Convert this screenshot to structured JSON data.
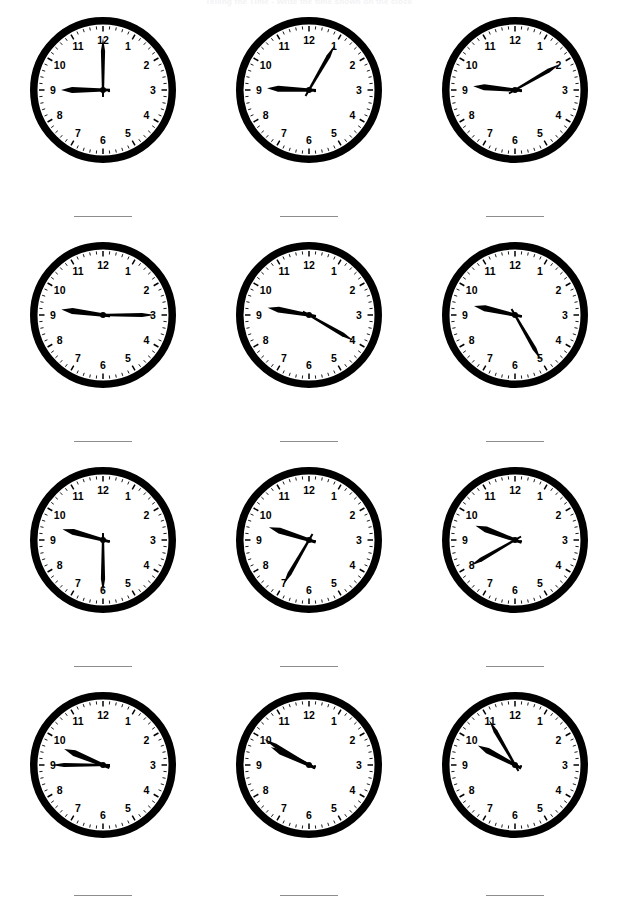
{
  "worksheet": {
    "title": "Telling the Time - Write the time shown on the clock",
    "rows": 4,
    "columns": 3,
    "clock_count": 12,
    "answer_line_placeholder": ""
  },
  "clock_face": {
    "rim_color": "#000000",
    "face_color": "#ffffff",
    "hand_color": "#000000",
    "numeral_color": "#000000",
    "tick_color": "#000000",
    "hour_numerals": [
      "12",
      "1",
      "2",
      "3",
      "4",
      "5",
      "6",
      "7",
      "8",
      "9",
      "10",
      "11"
    ]
  },
  "chart_data": {
    "type": "table",
    "title": "Telling the Time - Write the time shown on the clock",
    "categories": [
      "clock-1",
      "clock-2",
      "clock-3",
      "clock-4",
      "clock-5",
      "clock-6",
      "clock-7",
      "clock-8",
      "clock-9",
      "clock-10",
      "clock-11",
      "clock-12"
    ],
    "values": [
      {
        "index": 1,
        "time": "9:00",
        "hour": 9,
        "minute": 0,
        "hour_hand_angle_deg": 270,
        "minute_hand_angle_deg": 0,
        "answer": ""
      },
      {
        "index": 2,
        "time": "9:05",
        "hour": 9,
        "minute": 5,
        "hour_hand_angle_deg": 272.5,
        "minute_hand_angle_deg": 30,
        "answer": ""
      },
      {
        "index": 3,
        "time": "9:10",
        "hour": 9,
        "minute": 10,
        "hour_hand_angle_deg": 275,
        "minute_hand_angle_deg": 60,
        "answer": ""
      },
      {
        "index": 4,
        "time": "9:15",
        "hour": 9,
        "minute": 15,
        "hour_hand_angle_deg": 277.5,
        "minute_hand_angle_deg": 90,
        "answer": ""
      },
      {
        "index": 5,
        "time": "9:20",
        "hour": 9,
        "minute": 20,
        "hour_hand_angle_deg": 280,
        "minute_hand_angle_deg": 120,
        "answer": ""
      },
      {
        "index": 6,
        "time": "9:25",
        "hour": 9,
        "minute": 25,
        "hour_hand_angle_deg": 282.5,
        "minute_hand_angle_deg": 150,
        "answer": ""
      },
      {
        "index": 7,
        "time": "9:30",
        "hour": 9,
        "minute": 30,
        "hour_hand_angle_deg": 285,
        "minute_hand_angle_deg": 180,
        "answer": ""
      },
      {
        "index": 8,
        "time": "9:35",
        "hour": 9,
        "minute": 35,
        "hour_hand_angle_deg": 287.5,
        "minute_hand_angle_deg": 210,
        "answer": ""
      },
      {
        "index": 9,
        "time": "9:40",
        "hour": 9,
        "minute": 40,
        "hour_hand_angle_deg": 290,
        "minute_hand_angle_deg": 240,
        "answer": ""
      },
      {
        "index": 10,
        "time": "9:45",
        "hour": 9,
        "minute": 45,
        "hour_hand_angle_deg": 292.5,
        "minute_hand_angle_deg": 270,
        "answer": ""
      },
      {
        "index": 11,
        "time": "9:50",
        "hour": 9,
        "minute": 50,
        "hour_hand_angle_deg": 295,
        "minute_hand_angle_deg": 300,
        "answer": ""
      },
      {
        "index": 12,
        "time": "9:55",
        "hour": 9,
        "minute": 55,
        "hour_hand_angle_deg": 297.5,
        "minute_hand_angle_deg": 330,
        "answer": ""
      }
    ],
    "xlabel": "",
    "ylabel": ""
  }
}
